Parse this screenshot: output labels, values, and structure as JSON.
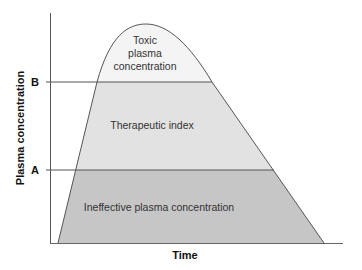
{
  "diagram": {
    "type": "plasma-concentration-time-curve",
    "x_axis_label": "Time",
    "y_axis_label": "Plasma concentration",
    "thresholds": [
      {
        "name": "A",
        "label": "A"
      },
      {
        "name": "B",
        "label": "B"
      }
    ],
    "regions": {
      "toxic": {
        "lines": [
          "Toxic",
          "plasma",
          "concentration"
        ],
        "color": "#f4f4f4"
      },
      "therapeutic": {
        "label": "Therapeutic index",
        "color": "#e2e2e2"
      },
      "ineffective": {
        "label": "Ineffective plasma concentration",
        "color": "#c6c6c6"
      }
    },
    "line_color": "#555555"
  }
}
